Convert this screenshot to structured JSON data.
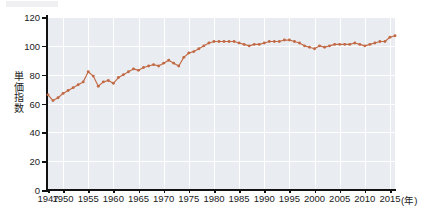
{
  "chart_data": {
    "type": "line",
    "title": "",
    "xlabel": "年",
    "ylabel": "単価指数",
    "xlim": [
      1947,
      2016
    ],
    "ylim": [
      0,
      120
    ],
    "y_ticks": [
      0,
      20,
      40,
      60,
      80,
      100,
      120
    ],
    "x_tick_labels": [
      "1947",
      "1950",
      "1955",
      "1960",
      "1965",
      "1970",
      "1975",
      "1980",
      "1985",
      "1990",
      "1995",
      "2000",
      "2005",
      "2010",
      "2015"
    ],
    "x_tick_values": [
      1947,
      1950,
      1955,
      1960,
      1965,
      1970,
      1975,
      1980,
      1985,
      1990,
      1995,
      2000,
      2005,
      2010,
      2015
    ],
    "x_unit_label": "(年)",
    "grid": true,
    "legend": "none",
    "series_color": "#c26a45",
    "marker": "circle",
    "plot_background": "#e9edf1",
    "gridline_color": "#ffffff",
    "axis_color": "#111111",
    "series": [
      {
        "name": "単価指数",
        "x": [
          1947,
          1948,
          1949,
          1950,
          1951,
          1952,
          1953,
          1954,
          1955,
          1956,
          1957,
          1958,
          1959,
          1960,
          1961,
          1962,
          1963,
          1964,
          1965,
          1966,
          1967,
          1968,
          1969,
          1970,
          1971,
          1972,
          1973,
          1974,
          1975,
          1976,
          1977,
          1978,
          1979,
          1980,
          1981,
          1982,
          1983,
          1984,
          1985,
          1986,
          1987,
          1988,
          1989,
          1990,
          1991,
          1992,
          1993,
          1994,
          1995,
          1996,
          1997,
          1998,
          1999,
          2000,
          2001,
          2002,
          2003,
          2004,
          2005,
          2006,
          2007,
          2008,
          2009,
          2010,
          2011,
          2012,
          2013,
          2014,
          2015,
          2016
        ],
        "values": [
          66,
          62,
          64,
          67,
          69,
          71,
          73,
          75,
          82,
          79,
          72,
          75,
          76,
          74,
          78,
          80,
          82,
          84,
          83,
          85,
          86,
          87,
          86,
          88,
          90,
          88,
          86,
          92,
          95,
          96,
          98,
          100,
          102,
          103,
          103,
          103,
          103,
          103,
          102,
          101,
          100,
          101,
          101,
          102,
          103,
          103,
          103,
          104,
          104,
          103,
          102,
          100,
          99,
          98,
          100,
          99,
          100,
          101,
          101,
          101,
          101,
          102,
          101,
          100,
          101,
          102,
          103,
          103,
          106,
          107
        ]
      }
    ]
  },
  "accessibility": {
    "figure_description": "単価指数 line chart, 1947 to 2016"
  }
}
